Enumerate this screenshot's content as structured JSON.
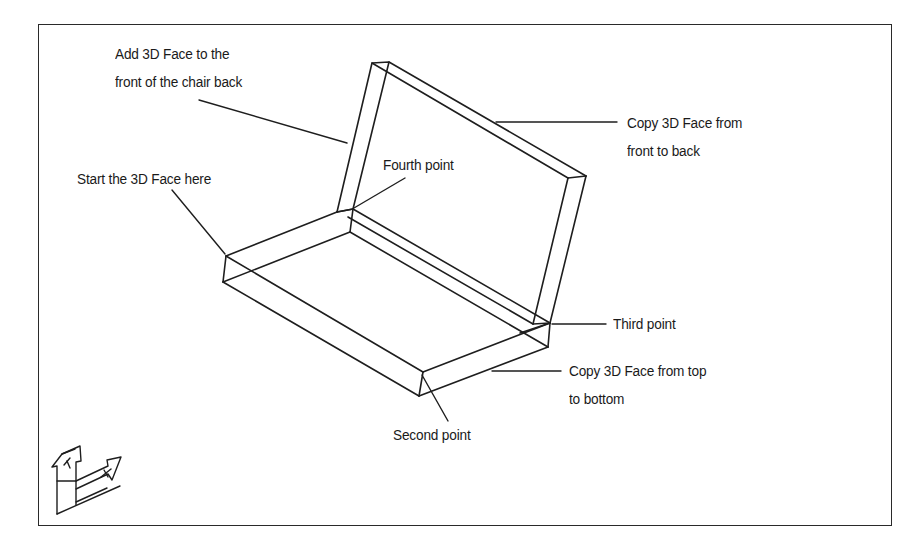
{
  "figure": {
    "colors": {
      "line": "#1e1e1e",
      "background": "#ffffff",
      "frame": "#2a2a2a"
    }
  },
  "callouts": {
    "add_front": {
      "line1": "Add 3D Face to the",
      "line2": "front of the chair back"
    },
    "copy_front_back": {
      "line1": "Copy 3D Face from",
      "line2": "front to back"
    },
    "start": {
      "text": "Start the 3D Face here"
    },
    "fourth": {
      "text": "Fourth point"
    },
    "third": {
      "text": "Third point"
    },
    "copy_top_bottom": {
      "line1": "Copy 3D Face from top",
      "line2": "to bottom"
    },
    "second": {
      "text": "Second point"
    }
  },
  "ucs_icon": {
    "x_label": "X",
    "y_label": "Y"
  }
}
